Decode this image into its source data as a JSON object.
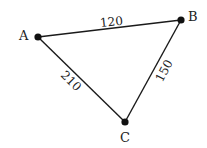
{
  "diagram": {
    "type": "weighted-graph",
    "nodes": [
      {
        "id": "A",
        "label": "A",
        "x": 38,
        "y": 37
      },
      {
        "id": "B",
        "label": "B",
        "x": 181,
        "y": 20
      },
      {
        "id": "C",
        "label": "C",
        "x": 125,
        "y": 122
      }
    ],
    "edges": [
      {
        "from": "A",
        "to": "B",
        "weight": "120"
      },
      {
        "from": "A",
        "to": "C",
        "weight": "210"
      },
      {
        "from": "B",
        "to": "C",
        "weight": "150"
      }
    ]
  }
}
